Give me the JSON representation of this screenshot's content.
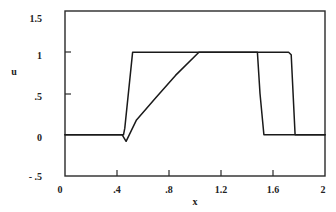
{
  "chart_data": {
    "type": "line",
    "title": "",
    "xlabel": "x",
    "ylabel": "u",
    "xlim": [
      0,
      2
    ],
    "ylim": [
      -0.5,
      1.5
    ],
    "grid": false,
    "legend": null,
    "x_ticks": [
      0,
      0.4,
      0.8,
      1.2,
      1.6,
      2
    ],
    "x_tick_labels": [
      "0",
      ".4",
      ".8",
      "1.2",
      "1.6",
      "2"
    ],
    "y_ticks": [
      -0.5,
      0,
      0.5,
      1,
      1.5
    ],
    "y_tick_labels": [
      "- .5",
      "0",
      ".5",
      "1",
      "1.5"
    ],
    "series": [
      {
        "name": "curve-1 (sharp profile)",
        "x": [
          0,
          0.45,
          0.46,
          0.52,
          1.48,
          1.5,
          1.53,
          2.0
        ],
        "y": [
          0,
          0,
          0.08,
          1,
          1,
          0.5,
          0,
          0
        ]
      },
      {
        "name": "curve-2 (smeared profile)",
        "x": [
          0,
          0.44,
          0.47,
          0.55,
          0.7,
          0.85,
          1.03,
          1.72,
          1.74,
          1.77,
          2.0
        ],
        "y": [
          0,
          0,
          -0.08,
          0.18,
          0.45,
          0.72,
          1,
          1,
          0.97,
          0,
          0
        ]
      }
    ]
  },
  "axes": {
    "xlabel": "x",
    "ylabel": "u",
    "x_tick_labels": [
      "0",
      ".4",
      ".8",
      "1.2",
      "1.6",
      "2"
    ],
    "y_tick_labels": [
      "1.5",
      "1",
      ".5",
      "0",
      "- .5"
    ]
  }
}
